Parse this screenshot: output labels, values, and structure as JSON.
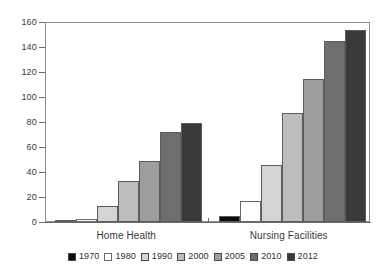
{
  "chart_data": {
    "type": "bar",
    "title": "",
    "xlabel": "",
    "ylabel": "",
    "ylim": [
      0,
      160
    ],
    "yticks": [
      0,
      20,
      40,
      60,
      80,
      100,
      120,
      140,
      160
    ],
    "grid": false,
    "legend_position": "bottom",
    "categories": [
      "Home Health",
      "Nursing Facilities"
    ],
    "series": [
      {
        "name": "1970",
        "color": "#0d0d0d",
        "values": [
          0.1,
          5
        ]
      },
      {
        "name": "1980",
        "color": "#ffffff",
        "values": [
          2.5,
          17
        ]
      },
      {
        "name": "1990",
        "color": "#d4d4d4",
        "values": [
          13,
          46
        ]
      },
      {
        "name": "2000",
        "color": "#bdbdbd",
        "values": [
          33,
          87
        ]
      },
      {
        "name": "2005",
        "color": "#9e9e9e",
        "values": [
          49,
          114.5
        ]
      },
      {
        "name": "2010",
        "color": "#6e6e6e",
        "values": [
          72,
          145
        ]
      },
      {
        "name": "2012",
        "color": "#3a3a3a",
        "values": [
          79.5,
          154
        ]
      }
    ]
  },
  "axis": {
    "y_tick_labels": [
      "0",
      "20",
      "40",
      "60",
      "80",
      "100",
      "120",
      "140",
      "160"
    ],
    "category_labels": [
      "Home Health",
      "Nursing Facilities"
    ]
  },
  "legend": {
    "items": [
      {
        "label": "1970"
      },
      {
        "label": "1980"
      },
      {
        "label": "1990"
      },
      {
        "label": "2000"
      },
      {
        "label": "2005"
      },
      {
        "label": "2010"
      },
      {
        "label": "2012"
      }
    ]
  }
}
